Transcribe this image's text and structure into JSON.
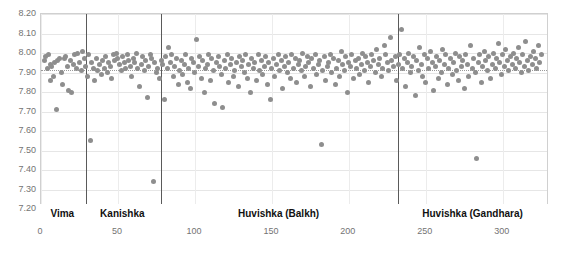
{
  "chart_data": {
    "type": "scatter",
    "title": "",
    "xlabel": "",
    "ylabel": "",
    "xlim": [
      0,
      330
    ],
    "ylim": [
      7.2,
      8.2
    ],
    "grid": true,
    "legend": false,
    "yticks": [
      "8.20",
      "8.10",
      "8.00",
      "7.90",
      "7.80",
      "7.70",
      "7.60",
      "7.50",
      "7.40",
      "7.30",
      "7.20"
    ],
    "ytick_values": [
      8.2,
      8.1,
      8.0,
      7.9,
      7.8,
      7.7,
      7.6,
      7.5,
      7.4,
      7.3,
      7.2
    ],
    "xticks": [
      "0",
      "50",
      "100",
      "150",
      "200",
      "250",
      "300"
    ],
    "xtick_values": [
      0,
      50,
      100,
      150,
      200,
      250,
      300
    ],
    "reference_line": {
      "label": "",
      "value": 7.915,
      "style": "dotted"
    },
    "group_dividers": [
      29,
      78,
      232
    ],
    "groups": [
      {
        "label": "Vima",
        "start": 0,
        "end": 29
      },
      {
        "label": "Kanishka",
        "start": 29,
        "end": 78
      },
      {
        "label": "Huvishka (Balkh)",
        "start": 78,
        "end": 232
      },
      {
        "label": "Huvishka (Gandhara)",
        "start": 232,
        "end": 330
      }
    ],
    "marker": {
      "shape": "circle",
      "color": "#8e8e8e",
      "size": 5
    },
    "points": [
      [
        2,
        7.96
      ],
      [
        3,
        7.98
      ],
      [
        4,
        7.92
      ],
      [
        5,
        7.99
      ],
      [
        6,
        7.94
      ],
      [
        6,
        7.86
      ],
      [
        7,
        7.93
      ],
      [
        8,
        7.88
      ],
      [
        9,
        7.95
      ],
      [
        10,
        7.71
      ],
      [
        11,
        7.96
      ],
      [
        12,
        7.97
      ],
      [
        13,
        7.9
      ],
      [
        14,
        7.84
      ],
      [
        15,
        7.97
      ],
      [
        16,
        7.98
      ],
      [
        17,
        7.93
      ],
      [
        18,
        7.81
      ],
      [
        19,
        7.96
      ],
      [
        20,
        7.8
      ],
      [
        21,
        7.94
      ],
      [
        22,
        7.99
      ],
      [
        23,
        7.92
      ],
      [
        24,
        8.0
      ],
      [
        25,
        7.95
      ],
      [
        26,
        7.91
      ],
      [
        27,
        8.01
      ],
      [
        28,
        7.97
      ],
      [
        29,
        7.93
      ],
      [
        30,
        7.88
      ],
      [
        31,
        7.99
      ],
      [
        32,
        7.55
      ],
      [
        33,
        7.95
      ],
      [
        34,
        7.92
      ],
      [
        35,
        7.86
      ],
      [
        36,
        7.97
      ],
      [
        37,
        7.91
      ],
      [
        38,
        7.94
      ],
      [
        39,
        7.89
      ],
      [
        40,
        7.96
      ],
      [
        41,
        7.92
      ],
      [
        42,
        7.98
      ],
      [
        43,
        7.9
      ],
      [
        44,
        7.95
      ],
      [
        45,
        7.93
      ],
      [
        46,
        7.87
      ],
      [
        47,
        7.99
      ],
      [
        48,
        7.96
      ],
      [
        49,
        8.0
      ],
      [
        50,
        7.97
      ],
      [
        51,
        7.94
      ],
      [
        52,
        7.91
      ],
      [
        53,
        7.98
      ],
      [
        54,
        7.95
      ],
      [
        55,
        7.92
      ],
      [
        56,
        7.99
      ],
      [
        57,
        7.96
      ],
      [
        58,
        7.93
      ],
      [
        59,
        7.88
      ],
      [
        60,
        7.97
      ],
      [
        61,
        7.95
      ],
      [
        62,
        8.0
      ],
      [
        63,
        7.92
      ],
      [
        64,
        7.83
      ],
      [
        65,
        7.94
      ],
      [
        66,
        7.98
      ],
      [
        67,
        7.91
      ],
      [
        68,
        7.96
      ],
      [
        69,
        7.77
      ],
      [
        70,
        7.93
      ],
      [
        71,
        7.99
      ],
      [
        72,
        7.97
      ],
      [
        73,
        7.34
      ],
      [
        74,
        7.95
      ],
      [
        75,
        7.9
      ],
      [
        76,
        7.92
      ],
      [
        77,
        7.87
      ],
      [
        78,
        7.96
      ],
      [
        79,
        7.94
      ],
      [
        80,
        7.76
      ],
      [
        81,
        7.98
      ],
      [
        82,
        7.92
      ],
      [
        83,
        8.03
      ],
      [
        84,
        7.95
      ],
      [
        85,
        7.99
      ],
      [
        86,
        7.88
      ],
      [
        87,
        7.93
      ],
      [
        88,
        7.97
      ],
      [
        89,
        7.84
      ],
      [
        90,
        7.91
      ],
      [
        91,
        7.96
      ],
      [
        92,
        7.89
      ],
      [
        93,
        7.94
      ],
      [
        94,
        7.99
      ],
      [
        95,
        7.85
      ],
      [
        96,
        7.92
      ],
      [
        97,
        7.82
      ],
      [
        98,
        7.97
      ],
      [
        99,
        7.95
      ],
      [
        100,
        7.9
      ],
      [
        101,
        8.07
      ],
      [
        102,
        7.93
      ],
      [
        103,
        7.98
      ],
      [
        104,
        7.87
      ],
      [
        105,
        7.96
      ],
      [
        106,
        7.8
      ],
      [
        107,
        7.92
      ],
      [
        108,
        7.94
      ],
      [
        109,
        7.99
      ],
      [
        110,
        7.86
      ],
      [
        111,
        7.97
      ],
      [
        112,
        7.91
      ],
      [
        113,
        7.74
      ],
      [
        114,
        7.95
      ],
      [
        115,
        7.98
      ],
      [
        116,
        7.93
      ],
      [
        117,
        7.89
      ],
      [
        118,
        7.72
      ],
      [
        119,
        7.96
      ],
      [
        120,
        7.92
      ],
      [
        121,
        7.99
      ],
      [
        122,
        7.85
      ],
      [
        123,
        7.94
      ],
      [
        124,
        7.97
      ],
      [
        125,
        7.88
      ],
      [
        126,
        7.91
      ],
      [
        127,
        7.95
      ],
      [
        128,
        7.83
      ],
      [
        129,
        7.98
      ],
      [
        130,
        7.93
      ],
      [
        131,
        7.96
      ],
      [
        132,
        7.9
      ],
      [
        133,
        7.99
      ],
      [
        134,
        7.87
      ],
      [
        135,
        7.94
      ],
      [
        136,
        7.8
      ],
      [
        137,
        7.97
      ],
      [
        138,
        7.92
      ],
      [
        139,
        7.95
      ],
      [
        140,
        7.86
      ],
      [
        141,
        7.99
      ],
      [
        142,
        7.91
      ],
      [
        143,
        7.96
      ],
      [
        144,
        7.89
      ],
      [
        145,
        7.93
      ],
      [
        146,
        7.98
      ],
      [
        147,
        7.84
      ],
      [
        148,
        7.95
      ],
      [
        149,
        7.76
      ],
      [
        150,
        7.92
      ],
      [
        151,
        7.97
      ],
      [
        152,
        7.88
      ],
      [
        153,
        7.94
      ],
      [
        154,
        7.99
      ],
      [
        155,
        7.91
      ],
      [
        156,
        7.96
      ],
      [
        157,
        7.82
      ],
      [
        158,
        7.93
      ],
      [
        159,
        7.98
      ],
      [
        160,
        7.9
      ],
      [
        161,
        7.95
      ],
      [
        162,
        7.87
      ],
      [
        163,
        7.99
      ],
      [
        164,
        7.92
      ],
      [
        165,
        7.97
      ],
      [
        166,
        7.85
      ],
      [
        167,
        7.94
      ],
      [
        168,
        7.96
      ],
      [
        169,
        7.91
      ],
      [
        170,
        8.0
      ],
      [
        171,
        7.88
      ],
      [
        172,
        7.93
      ],
      [
        173,
        7.98
      ],
      [
        174,
        7.95
      ],
      [
        175,
        7.83
      ],
      [
        176,
        7.97
      ],
      [
        177,
        7.92
      ],
      [
        178,
        7.99
      ],
      [
        179,
        7.89
      ],
      [
        180,
        7.94
      ],
      [
        181,
        7.96
      ],
      [
        182,
        7.53
      ],
      [
        183,
        7.91
      ],
      [
        184,
        7.98
      ],
      [
        185,
        7.86
      ],
      [
        186,
        7.93
      ],
      [
        187,
        7.95
      ],
      [
        188,
        7.99
      ],
      [
        189,
        7.9
      ],
      [
        190,
        7.97
      ],
      [
        191,
        7.84
      ],
      [
        192,
        7.92
      ],
      [
        193,
        7.96
      ],
      [
        194,
        7.88
      ],
      [
        195,
        8.01
      ],
      [
        196,
        7.94
      ],
      [
        197,
        7.91
      ],
      [
        198,
        7.98
      ],
      [
        199,
        7.8
      ],
      [
        200,
        7.95
      ],
      [
        201,
        7.93
      ],
      [
        202,
        7.99
      ],
      [
        203,
        7.87
      ],
      [
        204,
        7.96
      ],
      [
        205,
        7.92
      ],
      [
        206,
        7.97
      ],
      [
        207,
        7.89
      ],
      [
        208,
        7.94
      ],
      [
        209,
        8.0
      ],
      [
        210,
        7.91
      ],
      [
        211,
        7.98
      ],
      [
        212,
        7.95
      ],
      [
        213,
        7.85
      ],
      [
        214,
        7.93
      ],
      [
        215,
        7.99
      ],
      [
        216,
        7.96
      ],
      [
        217,
        7.9
      ],
      [
        218,
        8.02
      ],
      [
        219,
        7.94
      ],
      [
        220,
        7.97
      ],
      [
        221,
        7.88
      ],
      [
        222,
        7.92
      ],
      [
        223,
        8.04
      ],
      [
        224,
        7.99
      ],
      [
        225,
        7.95
      ],
      [
        226,
        7.91
      ],
      [
        227,
        8.08
      ],
      [
        228,
        7.96
      ],
      [
        229,
        7.93
      ],
      [
        230,
        7.98
      ],
      [
        231,
        7.86
      ],
      [
        232,
        7.94
      ],
      [
        233,
        7.99
      ],
      [
        234,
        8.12
      ],
      [
        235,
        7.92
      ],
      [
        236,
        7.97
      ],
      [
        237,
        7.83
      ],
      [
        238,
        7.95
      ],
      [
        239,
        8.0
      ],
      [
        240,
        7.9
      ],
      [
        241,
        7.93
      ],
      [
        242,
        7.98
      ],
      [
        243,
        7.78
      ],
      [
        244,
        7.96
      ],
      [
        245,
        7.91
      ],
      [
        246,
        8.03
      ],
      [
        247,
        7.94
      ],
      [
        248,
        7.88
      ],
      [
        249,
        7.99
      ],
      [
        250,
        7.85
      ],
      [
        251,
        7.97
      ],
      [
        252,
        7.92
      ],
      [
        253,
        8.01
      ],
      [
        254,
        7.95
      ],
      [
        255,
        7.81
      ],
      [
        256,
        7.93
      ],
      [
        257,
        7.98
      ],
      [
        258,
        7.87
      ],
      [
        259,
        7.96
      ],
      [
        260,
        7.9
      ],
      [
        261,
        8.02
      ],
      [
        262,
        7.94
      ],
      [
        263,
        7.99
      ],
      [
        264,
        7.84
      ],
      [
        265,
        7.92
      ],
      [
        266,
        7.97
      ],
      [
        267,
        7.89
      ],
      [
        268,
        7.95
      ],
      [
        269,
        8.0
      ],
      [
        270,
        7.91
      ],
      [
        271,
        7.86
      ],
      [
        272,
        7.98
      ],
      [
        273,
        7.93
      ],
      [
        274,
        7.96
      ],
      [
        275,
        7.82
      ],
      [
        276,
        7.99
      ],
      [
        277,
        7.94
      ],
      [
        278,
        7.88
      ],
      [
        279,
        8.04
      ],
      [
        280,
        7.92
      ],
      [
        281,
        7.97
      ],
      [
        282,
        7.9
      ],
      [
        283,
        7.46
      ],
      [
        284,
        7.95
      ],
      [
        285,
        7.99
      ],
      [
        286,
        7.85
      ],
      [
        287,
        7.93
      ],
      [
        288,
        8.01
      ],
      [
        289,
        7.96
      ],
      [
        290,
        7.91
      ],
      [
        291,
        7.98
      ],
      [
        292,
        7.87
      ],
      [
        293,
        7.94
      ],
      [
        294,
        8.0
      ],
      [
        295,
        7.92
      ],
      [
        296,
        7.97
      ],
      [
        297,
        8.05
      ],
      [
        298,
        7.95
      ],
      [
        299,
        7.89
      ],
      [
        300,
        7.99
      ],
      [
        301,
        7.93
      ],
      [
        302,
        8.02
      ],
      [
        303,
        7.96
      ],
      [
        304,
        7.91
      ],
      [
        305,
        7.98
      ],
      [
        306,
        7.94
      ],
      [
        307,
        8.0
      ],
      [
        308,
        7.92
      ],
      [
        309,
        7.97
      ],
      [
        310,
        8.03
      ],
      [
        311,
        7.95
      ],
      [
        312,
        7.9
      ],
      [
        313,
        7.99
      ],
      [
        314,
        7.93
      ],
      [
        315,
        8.06
      ],
      [
        316,
        7.96
      ],
      [
        317,
        7.91
      ],
      [
        318,
        7.98
      ],
      [
        319,
        7.94
      ],
      [
        320,
        8.01
      ],
      [
        321,
        7.97
      ],
      [
        322,
        7.92
      ],
      [
        323,
        8.04
      ],
      [
        324,
        7.95
      ],
      [
        325,
        7.99
      ]
    ]
  }
}
